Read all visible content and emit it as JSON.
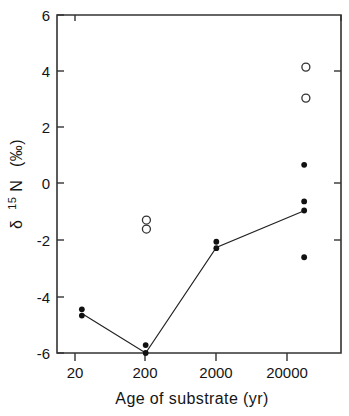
{
  "chart_data": {
    "type": "scatter",
    "title": "",
    "xlabel": "Age of substrate  (yr)",
    "ylabel": "δ ¹⁵N  (‰)",
    "xscale": "log",
    "xlim": [
      6.3,
      63000
    ],
    "ylim": [
      -6,
      6
    ],
    "xticks": [
      20,
      200,
      2000,
      20000
    ],
    "xtick_labels": [
      "20",
      "200",
      "2000",
      "20000"
    ],
    "yticks": [
      6,
      4,
      2,
      0,
      -2,
      -4,
      -6
    ],
    "ytick_labels": [
      "6",
      "4",
      "2",
      "0",
      "-2",
      "-4",
      "-6"
    ],
    "grid": false,
    "legend": false,
    "series": [
      {
        "name": "filled-symbols",
        "marker": "filled-circle",
        "points": [
          {
            "x": 25,
            "y": -4.45
          },
          {
            "x": 25,
            "y": -4.67
          },
          {
            "x": 200,
            "y": -5.72
          },
          {
            "x": 200,
            "y": -6.0
          },
          {
            "x": 2000,
            "y": -2.05
          },
          {
            "x": 2000,
            "y": -2.28
          },
          {
            "x": 35000,
            "y": 0.68
          },
          {
            "x": 35000,
            "y": -0.62
          },
          {
            "x": 35000,
            "y": -0.94
          },
          {
            "x": 35000,
            "y": -2.6
          }
        ]
      },
      {
        "name": "open-symbols",
        "marker": "open-circle",
        "points": [
          {
            "x": 205,
            "y": -1.28
          },
          {
            "x": 205,
            "y": -1.6
          },
          {
            "x": 37000,
            "y": 4.15
          },
          {
            "x": 37000,
            "y": 3.05
          }
        ]
      }
    ],
    "connecting_line": {
      "name": "mean-trend-line",
      "points": [
        {
          "x": 25,
          "y": -4.6
        },
        {
          "x": 200,
          "y": -6.0
        },
        {
          "x": 2000,
          "y": -2.25
        },
        {
          "x": 35000,
          "y": -0.95
        }
      ]
    }
  },
  "axes": {
    "x_axis_label": "Age of substrate  (yr)",
    "y_axis_label_delta": "δ",
    "y_axis_label_iso": "15",
    "y_axis_label_element": "N",
    "y_axis_label_units": "(‰)"
  },
  "colors": {
    "background": "#ffffff",
    "axis": "#333333",
    "marker_filled": "#111111",
    "marker_open_stroke": "#333333",
    "line": "#222222",
    "text": "#151515"
  }
}
